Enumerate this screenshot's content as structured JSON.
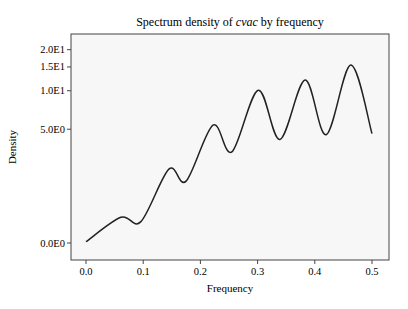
{
  "chart_data": {
    "type": "line",
    "title": "Spectrum density of cvac by frequency",
    "title_parts": {
      "prefix": "Spectrum density of ",
      "italic": "cvac",
      "suffix": " by frequency"
    },
    "xlabel": "Frequency",
    "ylabel": "Density",
    "xlim": [
      -0.025,
      0.525
    ],
    "ylim": [
      0,
      21
    ],
    "y_scale": "log1p",
    "x_ticks": [
      {
        "value": 0.0,
        "label": "0.0"
      },
      {
        "value": 0.1,
        "label": "0.1"
      },
      {
        "value": 0.2,
        "label": "0.2"
      },
      {
        "value": 0.3,
        "label": "0.3"
      },
      {
        "value": 0.4,
        "label": "0.4"
      },
      {
        "value": 0.5,
        "label": "0.5"
      }
    ],
    "y_ticks": [
      {
        "value": 0,
        "label": "0.0E0"
      },
      {
        "value": 5,
        "label": "5.0E0"
      },
      {
        "value": 10,
        "label": "1.0E1"
      },
      {
        "value": 15,
        "label": "1.5E1"
      },
      {
        "value": 20,
        "label": "2.0E1"
      }
    ],
    "grid": false,
    "legend": null,
    "series": [
      {
        "name": "cvac",
        "color": "#222222",
        "x": [
          0.0,
          0.061,
          0.096,
          0.145,
          0.175,
          0.222,
          0.255,
          0.301,
          0.339,
          0.383,
          0.42,
          0.463,
          0.5
        ],
        "y": [
          0.02,
          0.5,
          0.4,
          2.2,
          1.65,
          5.4,
          3.2,
          10.1,
          4.1,
          12.0,
          4.5,
          15.5,
          4.6
        ]
      }
    ]
  },
  "colors": {
    "plot_background": "#f7f7f7",
    "frame": "#444444",
    "line": "#222222"
  }
}
